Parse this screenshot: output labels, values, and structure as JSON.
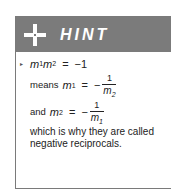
{
  "hint": {
    "title": "HINT",
    "icon": "plus-icon",
    "colors": {
      "header_bg": "#7b7b7b",
      "border": "#7a7a7a",
      "text": "#222222"
    },
    "lines": {
      "line1": {
        "bullet": "▸",
        "lhs_m1": "m",
        "lhs_s1": "1",
        "lhs_m2": "m",
        "lhs_s2": "2",
        "eq": "=",
        "rhs": "−1"
      },
      "line2": {
        "prefix": "means",
        "var": "m",
        "sub": "1",
        "eq": "=",
        "minus": "−",
        "num": "1",
        "den_var": "m",
        "den_sub": "2"
      },
      "line3": {
        "prefix": "and",
        "var": "m",
        "sub": "2",
        "eq": "=",
        "minus": "−",
        "num": "1",
        "den_var": "m",
        "den_sub": "1"
      },
      "line4": "which is why they are called",
      "line5": "negative reciprocals."
    }
  }
}
